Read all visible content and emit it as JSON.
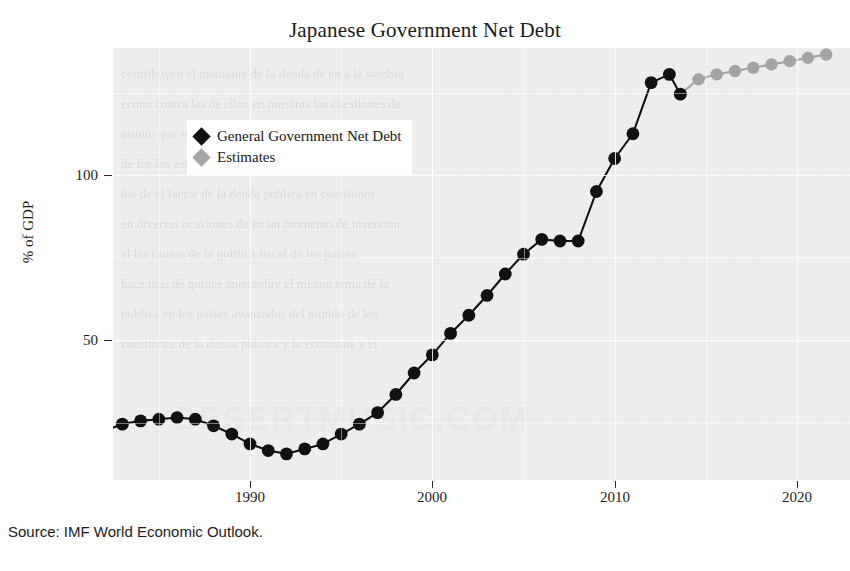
{
  "chart_data": {
    "type": "line",
    "title": "Japanese Government Net Debt",
    "xlabel": "",
    "ylabel": "% of GDP",
    "xlim": [
      1980,
      2021.5
    ],
    "ylim": [
      0,
      145
    ],
    "xticks": [
      1990,
      2000,
      2010,
      2020
    ],
    "yticks": [
      50,
      100
    ],
    "grid": true,
    "legend_position": "upper-left-inside",
    "series": [
      {
        "name": "General Government Net Debt",
        "color": "#111111",
        "marker": "circle",
        "x": [
          1980,
          1981,
          1982,
          1983,
          1984,
          1985,
          1986,
          1987,
          1988,
          1989,
          1990,
          1991,
          1992,
          1993,
          1994,
          1995,
          1996,
          1997,
          1998,
          1999,
          2000,
          2001,
          2002,
          2003,
          2004,
          2005,
          2006,
          2007,
          2008,
          2009,
          2010,
          2011,
          2012,
          2013
        ],
        "y": [
          16.5,
          19.5,
          22.5,
          24.5,
          25.5,
          26.0,
          26.5,
          26.0,
          24.0,
          21.5,
          18.5,
          16.5,
          15.5,
          17.0,
          18.5,
          21.5,
          24.5,
          28.0,
          33.5,
          40.0,
          45.5,
          52.0,
          57.5,
          63.5,
          70.0,
          76.0,
          80.5,
          80.0,
          80.0,
          95.0,
          105.0,
          112.5,
          128.0,
          130.5
        ]
      },
      {
        "name": "Estimates",
        "color": "#a5a5a5",
        "marker": "circle",
        "x": [
          2013,
          2014,
          2015,
          2016,
          2017,
          2018,
          2019,
          2020,
          2021
        ],
        "y": [
          124.5,
          129.0,
          130.5,
          131.5,
          132.5,
          133.5,
          134.5,
          135.5,
          136.5
        ]
      }
    ],
    "connector": {
      "from": {
        "x": 2013,
        "y": 124.5
      },
      "to": {
        "x": 2014,
        "y": 129.0
      },
      "note": "last observed black point dips before gray estimates resume"
    },
    "black_tail": {
      "x": [
        2012,
        2013,
        2013.6
      ],
      "y": [
        128.0,
        130.5,
        124.5
      ]
    }
  },
  "legend": {
    "items": [
      {
        "label": "General Government Net Debt",
        "color": "#111111"
      },
      {
        "label": "Estimates",
        "color": "#a5a5a5"
      }
    ]
  },
  "axis": {
    "y_label": "% of GDP",
    "y_ticks": [
      "100",
      "50"
    ],
    "x_ticks": [
      "1990",
      "2000",
      "2010",
      "2020"
    ]
  },
  "source": {
    "text": "Source: IMF World Economic Outlook."
  },
  "watermark": {
    "big": "DESERTMUSIC.COM",
    "lines": [
      "contribuyen el montante de la deuda  de  en  a   la  sombra",
      "econo contra las de ellos  en  nuestras  las  cuestiones  de",
      "asunto que se trata de  ellos  con  los  que  los  trabajos",
      "de los  los estudios  de  mediado  la  una  de  los  estados",
      "los de  el  factor  de  la  deuda  publica  en  cuestiones",
      "en diversas  ocasiones  de  en  un  momento  de  inversion",
      "el las  causas  de  la  politica  fiscal  de  los  paises",
      "hace  mas  de  quince  anos  sobre  el  mismo  tema  de  la",
      "publica  en  los  paises  avanzados  del  mundo  de  los",
      "cuestiones  de  la  deuda  publica  y  la  economia  y  el"
    ]
  }
}
